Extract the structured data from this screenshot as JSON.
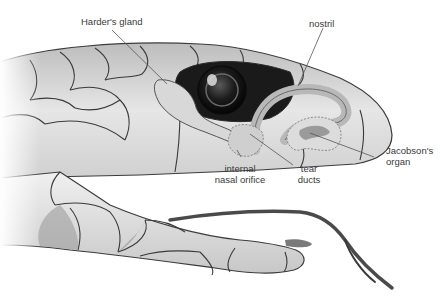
{
  "diagram": {
    "labels": [
      {
        "id": "hardersgland",
        "text": "Harder's gland"
      },
      {
        "id": "nostril",
        "text": "nostril"
      },
      {
        "id": "jacobsons1",
        "text": "Jacobson's"
      },
      {
        "id": "jacobsons2",
        "text": "organ"
      },
      {
        "id": "nasal1",
        "text": "internal"
      },
      {
        "id": "nasal2",
        "text": "nasal orifice"
      },
      {
        "id": "tear1",
        "text": "tear"
      },
      {
        "id": "tear2",
        "text": "ducts"
      }
    ],
    "colors": {
      "scale_light": "#e8e8e8",
      "scale_mid": "#c4c4c4",
      "scale_dark": "#8a8a8a",
      "outline": "#3c3c3c",
      "eye": "#151515",
      "leader": "#555555",
      "text": "#3a3a3a"
    }
  }
}
